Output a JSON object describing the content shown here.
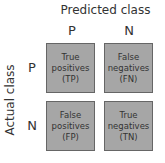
{
  "title": "Predicted class",
  "y_axis_label": "Actual class",
  "columns": [
    "P",
    "N"
  ],
  "rows": [
    "P",
    "N"
  ],
  "cells": [
    {
      "line1": "True",
      "line2": "positives",
      "line3": "(TP)"
    },
    {
      "line1": "False",
      "line2": "negatives",
      "line3": "(FN)"
    },
    {
      "line1": "False",
      "line2": "positives",
      "line3": "(FP)"
    },
    {
      "line1": "True",
      "line2": "negatives",
      "line3": "(TN)"
    }
  ],
  "colors": {
    "cell_fill": "#a6a6a6",
    "cell_border": "#666666",
    "text": "#333333"
  }
}
